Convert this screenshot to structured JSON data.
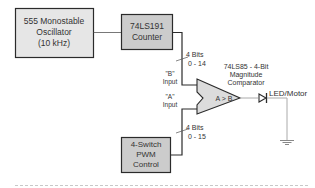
{
  "diagram": {
    "blocks": {
      "oscillator": {
        "lines": [
          "555 Monostable",
          "Oscillator",
          "(10 kHz)"
        ],
        "fill": "#e6e6e6"
      },
      "counter": {
        "lines": [
          "74LS191",
          "Counter"
        ],
        "fill": "#cccccc"
      },
      "pwm_control": {
        "lines": [
          "4-Switch",
          "PWM",
          "Control"
        ],
        "fill": "#cccccc"
      }
    },
    "comparator": {
      "title_lines": [
        "74LS85 - 4-Bit",
        "Magnitude",
        "Comparator"
      ],
      "operation": "A > B",
      "input_b": [
        "\"B\"",
        "Input"
      ],
      "input_a": [
        "\"A\"",
        "Input"
      ],
      "fill": "#dcdcdc"
    },
    "buses": {
      "counter_bus": [
        "4 Bits",
        "0 - 14"
      ],
      "pwm_bus": [
        "4 Bits",
        "0 - 15"
      ]
    },
    "output": {
      "label": "LED/Motor",
      "diode": "diode-symbol",
      "ground": "ground-symbol"
    },
    "colors": {
      "stroke": "#2b2b2b",
      "wire_light": "#aaaaaa",
      "dashed_rule": "#c8c8c8"
    }
  }
}
